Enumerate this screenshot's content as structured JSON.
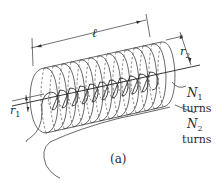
{
  "figure": {
    "caption": "(a)"
  },
  "labels": {
    "length": "ℓ",
    "r2_main": "r",
    "r2_sub": "2",
    "r1_main": "r",
    "r1_sub": "1",
    "n1_main": "N",
    "n1_sub": "1",
    "n1_turns": "turns",
    "n2_main": "N",
    "n2_sub": "2",
    "n2_turns": "turns"
  },
  "colors": {
    "line": "#333333",
    "background": "#ffffff"
  }
}
